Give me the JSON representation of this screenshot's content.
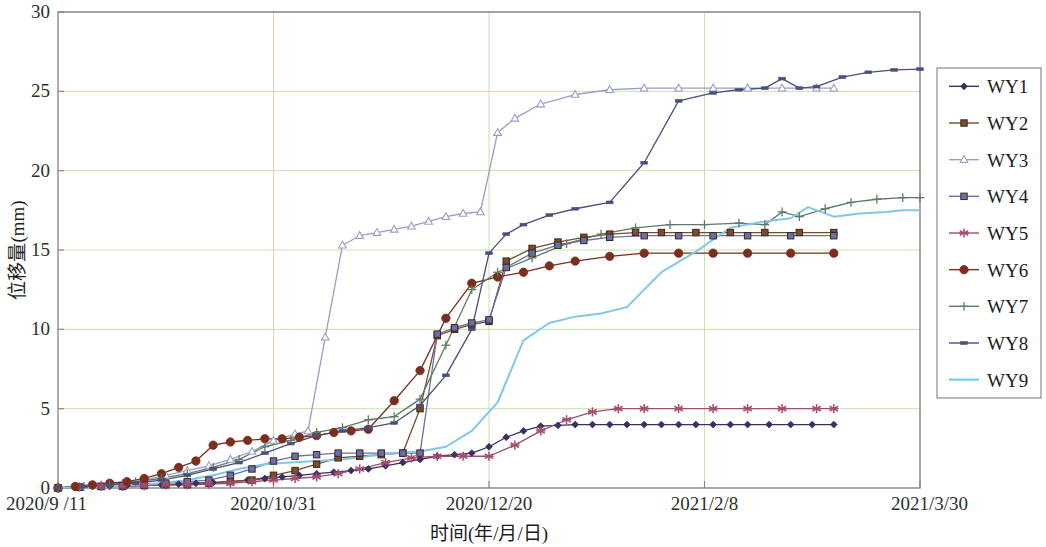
{
  "chart_data": {
    "type": "line",
    "title": "",
    "xlabel": "时间(年/月/日)",
    "ylabel": "位移量(mm)",
    "ylim": [
      0,
      30
    ],
    "yticks": [
      0,
      5,
      10,
      15,
      20,
      25,
      30
    ],
    "ytick_labels": [
      "0",
      "5",
      "10",
      "15",
      "20",
      "25",
      "30"
    ],
    "xtick_labels": [
      "2020/9 /11",
      "2020/10/31",
      "2020/12/20",
      "2021/2/8",
      "2021/3/30"
    ],
    "xtick_positions": [
      0,
      50,
      100,
      150,
      200
    ],
    "xlim": [
      0,
      200
    ],
    "grid": true,
    "legend_position": "right",
    "legend_entries": [
      "WY1",
      "WY2",
      "WY3",
      "WY4",
      "WY5",
      "WY6",
      "WY7",
      "WY8",
      "WY9"
    ],
    "colors": {
      "WY1": "#3b2f63",
      "WY2": "#7b4b2a",
      "WY3": "#9a9dc4",
      "WY4": "#6a6fa8",
      "WY5": "#a44b6e",
      "WY6": "#7b2e1e",
      "WY7": "#5f7a63",
      "WY8": "#4a4f7d",
      "WY9": "#7fc8e8"
    },
    "markers": {
      "WY1": "diamond",
      "WY2": "square",
      "WY3": "triangle",
      "WY4": "square",
      "WY5": "star",
      "WY6": "circle",
      "WY7": "plus",
      "WY8": "dash",
      "WY9": "none"
    },
    "series": [
      {
        "name": "WY1",
        "x": [
          0,
          4,
          8,
          12,
          16,
          20,
          24,
          28,
          32,
          36,
          40,
          44,
          48,
          52,
          56,
          60,
          64,
          68,
          72,
          76,
          80,
          84,
          88,
          92,
          96,
          100,
          104,
          108,
          112,
          116,
          120,
          124,
          128,
          132,
          136,
          140,
          144,
          148,
          152,
          156,
          160,
          165,
          170,
          175,
          180
        ],
        "values": [
          0.0,
          0.05,
          0.1,
          0.1,
          0.15,
          0.2,
          0.2,
          0.25,
          0.3,
          0.35,
          0.4,
          0.5,
          0.6,
          0.7,
          0.8,
          0.9,
          1.0,
          1.1,
          1.2,
          1.4,
          1.6,
          1.8,
          2.0,
          2.1,
          2.2,
          2.6,
          3.2,
          3.6,
          3.9,
          3.95,
          4.0,
          4.0,
          4.0,
          4.0,
          4.0,
          4.0,
          4.0,
          4.0,
          4.0,
          4.0,
          4.0,
          4.0,
          4.0,
          4.0,
          4.0
        ]
      },
      {
        "name": "WY2",
        "x": [
          0,
          5,
          10,
          15,
          20,
          25,
          30,
          35,
          40,
          45,
          50,
          55,
          60,
          65,
          70,
          75,
          80,
          84,
          88,
          92,
          96,
          100,
          104,
          110,
          116,
          122,
          128,
          134,
          140,
          148,
          156,
          164,
          172,
          180
        ],
        "values": [
          0.0,
          0.05,
          0.1,
          0.1,
          0.15,
          0.2,
          0.2,
          0.3,
          0.4,
          0.5,
          0.8,
          1.1,
          1.5,
          1.9,
          2.0,
          2.1,
          2.2,
          5.0,
          9.6,
          10.0,
          10.3,
          10.5,
          14.3,
          15.1,
          15.5,
          15.8,
          16.0,
          16.1,
          16.1,
          16.1,
          16.1,
          16.1,
          16.1,
          16.1
        ]
      },
      {
        "name": "WY3",
        "x": [
          0,
          5,
          10,
          15,
          20,
          25,
          30,
          35,
          40,
          45,
          50,
          55,
          58,
          62,
          66,
          70,
          74,
          78,
          82,
          86,
          90,
          94,
          98,
          102,
          106,
          112,
          120,
          128,
          136,
          144,
          152,
          160,
          168,
          176,
          180
        ],
        "values": [
          0.0,
          0.1,
          0.2,
          0.3,
          0.5,
          0.8,
          1.1,
          1.4,
          1.8,
          2.3,
          3.0,
          3.4,
          3.6,
          9.5,
          15.3,
          15.9,
          16.1,
          16.3,
          16.5,
          16.8,
          17.1,
          17.3,
          17.4,
          22.4,
          23.3,
          24.2,
          24.8,
          25.1,
          25.2,
          25.2,
          25.2,
          25.2,
          25.2,
          25.2,
          25.2
        ]
      },
      {
        "name": "WY4",
        "x": [
          0,
          5,
          10,
          15,
          20,
          25,
          30,
          35,
          40,
          45,
          50,
          55,
          60,
          65,
          70,
          75,
          80,
          84,
          88,
          92,
          96,
          100,
          104,
          110,
          116,
          122,
          128,
          136,
          144,
          152,
          160,
          170,
          180
        ],
        "values": [
          0.0,
          0.05,
          0.1,
          0.15,
          0.2,
          0.3,
          0.4,
          0.5,
          0.8,
          1.2,
          1.7,
          2.0,
          2.1,
          2.2,
          2.2,
          2.2,
          2.2,
          2.2,
          9.7,
          10.1,
          10.4,
          10.6,
          13.9,
          14.8,
          15.3,
          15.6,
          15.8,
          15.9,
          15.9,
          15.9,
          15.9,
          15.9,
          15.9
        ]
      },
      {
        "name": "WY5",
        "x": [
          0,
          5,
          10,
          15,
          20,
          25,
          30,
          35,
          40,
          45,
          50,
          55,
          60,
          65,
          70,
          76,
          82,
          88,
          94,
          100,
          106,
          112,
          118,
          124,
          130,
          136,
          144,
          152,
          160,
          168,
          176,
          180
        ],
        "values": [
          0.0,
          0.05,
          0.1,
          0.1,
          0.15,
          0.2,
          0.2,
          0.25,
          0.3,
          0.4,
          0.5,
          0.6,
          0.7,
          0.9,
          1.2,
          1.6,
          1.9,
          2.0,
          2.0,
          2.0,
          2.7,
          3.6,
          4.3,
          4.8,
          5.0,
          5.0,
          5.0,
          5.0,
          5.0,
          5.0,
          5.0,
          5.0
        ]
      },
      {
        "name": "WY6",
        "x": [
          0,
          4,
          8,
          12,
          16,
          20,
          24,
          28,
          32,
          36,
          40,
          44,
          48,
          52,
          56,
          60,
          64,
          68,
          72,
          78,
          84,
          90,
          96,
          102,
          108,
          114,
          120,
          128,
          136,
          144,
          152,
          160,
          170,
          180
        ],
        "values": [
          0.0,
          0.1,
          0.2,
          0.3,
          0.4,
          0.6,
          0.9,
          1.3,
          1.7,
          2.7,
          2.9,
          3.0,
          3.1,
          3.1,
          3.2,
          3.3,
          3.5,
          3.6,
          3.7,
          5.5,
          7.4,
          10.7,
          12.9,
          13.3,
          13.6,
          14.0,
          14.3,
          14.6,
          14.8,
          14.8,
          14.8,
          14.8,
          14.8,
          14.8
        ]
      },
      {
        "name": "WY7",
        "x": [
          0,
          6,
          12,
          18,
          24,
          30,
          36,
          42,
          48,
          54,
          60,
          66,
          72,
          78,
          84,
          90,
          96,
          102,
          110,
          118,
          126,
          134,
          142,
          150,
          158,
          164,
          168,
          172,
          178,
          184,
          190,
          196,
          200
        ],
        "values": [
          0.0,
          0.1,
          0.2,
          0.4,
          0.6,
          0.9,
          1.3,
          1.8,
          2.6,
          3.0,
          3.5,
          3.8,
          4.3,
          4.5,
          5.6,
          9.0,
          12.5,
          13.6,
          14.5,
          15.4,
          16.0,
          16.4,
          16.6,
          16.6,
          16.7,
          16.6,
          17.4,
          17.1,
          17.6,
          18.0,
          18.2,
          18.3,
          18.3
        ]
      },
      {
        "name": "WY8",
        "x": [
          0,
          6,
          12,
          18,
          24,
          30,
          36,
          42,
          48,
          54,
          60,
          66,
          72,
          78,
          84,
          90,
          96,
          100,
          104,
          108,
          114,
          120,
          128,
          136,
          144,
          152,
          158,
          164,
          168,
          172,
          176,
          182,
          188,
          194,
          200
        ],
        "values": [
          0.0,
          0.1,
          0.2,
          0.3,
          0.5,
          0.8,
          1.2,
          1.6,
          2.2,
          2.8,
          3.3,
          3.6,
          3.8,
          4.1,
          5.2,
          7.1,
          10.0,
          14.8,
          16.0,
          16.6,
          17.2,
          17.6,
          18.0,
          20.5,
          24.4,
          24.9,
          25.1,
          25.2,
          25.8,
          25.2,
          25.3,
          25.9,
          26.2,
          26.35,
          26.4
        ]
      },
      {
        "name": "WY9",
        "x": [
          0,
          6,
          12,
          18,
          24,
          30,
          36,
          42,
          48,
          54,
          60,
          66,
          72,
          78,
          84,
          90,
          96,
          102,
          108,
          114,
          120,
          126,
          132,
          140,
          148,
          156,
          164,
          170,
          174,
          180,
          186,
          192,
          196,
          200
        ],
        "values": [
          0.0,
          0.05,
          0.1,
          0.2,
          0.3,
          0.5,
          0.8,
          1.2,
          1.5,
          1.6,
          1.7,
          1.8,
          2.0,
          2.2,
          2.3,
          2.6,
          3.6,
          5.4,
          9.3,
          10.4,
          10.8,
          11.0,
          11.4,
          13.6,
          14.9,
          16.4,
          16.8,
          17.0,
          17.7,
          17.1,
          17.3,
          17.4,
          17.5,
          17.5
        ]
      }
    ]
  }
}
